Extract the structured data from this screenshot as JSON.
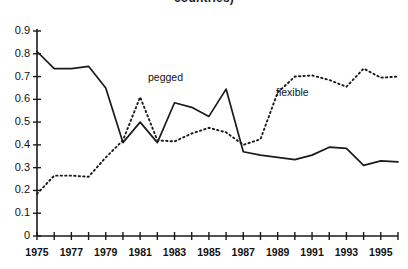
{
  "chart_data": {
    "type": "line",
    "title": "countries)",
    "xlabel": "",
    "ylabel": "",
    "xlim": [
      1975,
      1996
    ],
    "ylim": [
      0,
      0.9
    ],
    "grid": false,
    "legend_position": "inline-annotations",
    "x": [
      1975,
      1976,
      1977,
      1978,
      1979,
      1980,
      1981,
      1982,
      1983,
      1984,
      1985,
      1986,
      1987,
      1988,
      1989,
      1990,
      1991,
      1992,
      1993,
      1994,
      1995,
      1996
    ],
    "xtick_labels": [
      "1975",
      "1977",
      "1979",
      "1981",
      "1983",
      "1985",
      "1987",
      "1989",
      "1991",
      "1993",
      "1995"
    ],
    "ytick_labels": [
      "0",
      "0.1",
      "0.2",
      "0.3",
      "0.4",
      "0.5",
      "0.6",
      "0.7",
      "0.8",
      "0.9"
    ],
    "ytick_values": [
      0,
      0.1,
      0.2,
      0.3,
      0.4,
      0.5,
      0.6,
      0.7,
      0.8,
      0.9
    ],
    "series": [
      {
        "name": "pegged",
        "style": "solid",
        "color": "#1a1a1a",
        "values": [
          0.81,
          0.735,
          0.735,
          0.745,
          0.65,
          0.41,
          0.5,
          0.41,
          0.585,
          0.565,
          0.525,
          0.645,
          0.37,
          0.355,
          0.345,
          0.335,
          0.355,
          0.39,
          0.385,
          0.31,
          0.33,
          0.325
        ]
      },
      {
        "name": "flexible",
        "style": "dotted",
        "color": "#1a1a1a",
        "values": [
          0.185,
          0.265,
          0.265,
          0.26,
          0.345,
          0.42,
          0.61,
          0.42,
          0.415,
          0.45,
          0.475,
          0.455,
          0.4,
          0.425,
          0.63,
          0.7,
          0.705,
          0.685,
          0.655,
          0.735,
          0.695,
          0.7
        ]
      }
    ],
    "annotations": [
      {
        "text": "pegged",
        "x": 1981.5,
        "y": 0.635
      },
      {
        "text": "flexible",
        "x": 1988.8,
        "y": 0.59
      }
    ]
  }
}
